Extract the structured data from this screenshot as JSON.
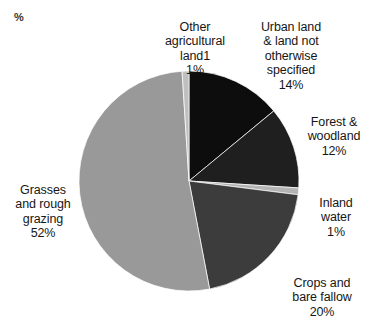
{
  "chart_data": {
    "type": "pie",
    "title": "",
    "unit_label": "%",
    "legend_position": "callout-labels",
    "grid": false,
    "total": 100,
    "categories": [
      "Urban land & land not otherwise specified",
      "Forest & woodland",
      "Inland water",
      "Crops and bare fallow",
      "Grasses and rough grazing",
      "Other agricultural land1"
    ],
    "values": [
      14,
      12,
      1,
      20,
      52,
      1
    ],
    "colors": [
      "#0d0d0d",
      "#1f1f1f",
      "#b4b4b4",
      "#3c3c3c",
      "#999999",
      "#bfbfbf"
    ],
    "slices": [
      {
        "id": "urban-land",
        "name": "Urban land & land not otherwise specified",
        "label_lines": "Urban land\n& land not\notherwise\nspecified",
        "value": 14,
        "pct_text": "14%",
        "color": "#0d0d0d"
      },
      {
        "id": "forest-woodland",
        "name": "Forest & woodland",
        "label_lines": "Forest &\nwoodland",
        "value": 12,
        "pct_text": "12%",
        "color": "#1f1f1f"
      },
      {
        "id": "inland-water",
        "name": "Inland water",
        "label_lines": "Inland\nwater",
        "value": 1,
        "pct_text": "1%",
        "color": "#b4b4b4"
      },
      {
        "id": "crops-bare-fallow",
        "name": "Crops and bare fallow",
        "label_lines": "Crops and\nbare fallow",
        "value": 20,
        "pct_text": "20%",
        "color": "#3c3c3c"
      },
      {
        "id": "grasses-rough-grazing",
        "name": "Grasses and rough grazing",
        "label_lines": "Grasses\nand rough\ngrazing",
        "value": 52,
        "pct_text": "52%",
        "color": "#999999"
      },
      {
        "id": "other-agricultural-land",
        "name": "Other agricultural land1",
        "label_lines": "Other\nagricultural\nland1",
        "value": 1,
        "pct_text": "1%",
        "color": "#bfbfbf"
      }
    ]
  },
  "geometry": {
    "center_x": 189,
    "center_y": 181,
    "radius": 110,
    "start_angle_deg": 0,
    "direction": "clockwise"
  }
}
